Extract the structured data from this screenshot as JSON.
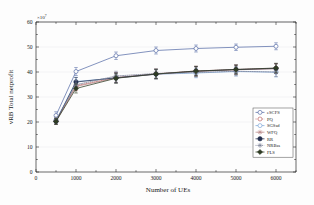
{
  "chart_data": {
    "type": "line",
    "title": "",
    "xlabel": "Number of UEs",
    "ylabel": "vRB Total netprofit",
    "y_exponent_label": "×10",
    "y_exponent_value": "7",
    "xlim": [
      0,
      6500
    ],
    "ylim": [
      0,
      60
    ],
    "xticks": [
      0,
      1000,
      2000,
      3000,
      4000,
      5000,
      6000
    ],
    "xtick_labels": [
      "0",
      "1000",
      "2000",
      "3000",
      "4000",
      "5000",
      "6000"
    ],
    "yticks": [
      0,
      10,
      20,
      30,
      40,
      50,
      60
    ],
    "ytick_labels": [
      "0",
      "10",
      "20",
      "30",
      "40",
      "50",
      "60"
    ],
    "grid": true,
    "legend_position": "lower-right",
    "x": [
      500,
      1000,
      2000,
      3000,
      4000,
      5000,
      6000
    ],
    "series": [
      {
        "name": "eSCFS",
        "color": "#5a6fa8",
        "marker": "circle-open",
        "linestyle": "solid",
        "values": [
          22.6,
          40.2,
          46.5,
          48.6,
          49.4,
          49.9,
          50.3
        ],
        "errors": [
          1.5,
          1.6,
          1.5,
          1.4,
          1.4,
          1.3,
          1.4
        ]
      },
      {
        "name": "PQ",
        "color": "#c06a6a",
        "marker": "circle-open",
        "linestyle": "dotted",
        "values": [
          20.3,
          34.5,
          37.8,
          39.3,
          40.4,
          41.0,
          41.5
        ],
        "errors": [
          1.2,
          1.8,
          2.0,
          1.9,
          1.9,
          1.8,
          1.9
        ]
      },
      {
        "name": "SGSsd",
        "color": "#7fa8d8",
        "marker": "circle-open",
        "linestyle": "solid",
        "values": [
          20.6,
          36.2,
          37.6,
          39.1,
          39.6,
          40.2,
          39.9
        ],
        "errors": [
          1.2,
          1.7,
          1.9,
          1.8,
          1.9,
          1.8,
          1.9
        ]
      },
      {
        "name": "WFQ",
        "color": "#b98a8a",
        "marker": "star",
        "linestyle": "solid",
        "values": [
          20.4,
          34.2,
          37.6,
          39.1,
          40.2,
          40.9,
          41.3
        ],
        "errors": [
          1.2,
          1.7,
          1.9,
          1.8,
          1.9,
          1.8,
          1.9
        ]
      },
      {
        "name": "RR",
        "color": "#24304f",
        "marker": "circle-filled",
        "linestyle": "solid",
        "values": [
          20.3,
          36.0,
          37.7,
          39.2,
          40.3,
          41.0,
          41.4
        ],
        "errors": [
          1.2,
          1.8,
          2.0,
          1.9,
          1.9,
          1.8,
          1.9
        ]
      },
      {
        "name": "NRBss",
        "color": "#7a7f95",
        "marker": "asterisk",
        "linestyle": "dotted",
        "values": [
          20.8,
          34.9,
          38.4,
          39.4,
          39.8,
          40.3,
          40.0
        ],
        "errors": [
          1.2,
          1.7,
          1.9,
          1.8,
          1.8,
          1.8,
          1.8
        ]
      },
      {
        "name": "FLS",
        "color": "#2e3b23",
        "marker": "diamond-filled",
        "linestyle": "solid",
        "values": [
          20.2,
          33.4,
          37.5,
          39.2,
          40.4,
          41.0,
          41.6
        ],
        "errors": [
          1.2,
          1.8,
          2.0,
          1.9,
          1.9,
          1.8,
          1.9
        ]
      }
    ]
  }
}
